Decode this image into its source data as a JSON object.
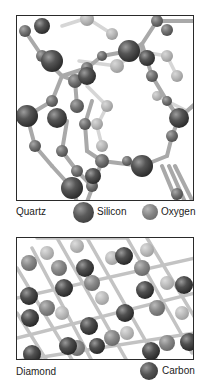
{
  "figure": {
    "panels": [
      {
        "id": "quartz",
        "name": "Quartz",
        "legend": [
          {
            "label": "Silicon",
            "color": "#4a4a4a",
            "size": "large"
          },
          {
            "label": "Oxygen",
            "color": "#808080",
            "size": "small"
          }
        ]
      },
      {
        "id": "diamond",
        "name": "Diamond",
        "legend": [
          {
            "label": "Carbon",
            "color": "#454545",
            "size": "large"
          }
        ]
      }
    ],
    "colors": {
      "bond": "#b5b5b5",
      "bond_dark": "#8f8f8f",
      "atom_dark": "#444444",
      "atom_mid": "#7a7a7a",
      "atom_light": "#b0b0b0",
      "border": "#2a2a2a"
    }
  }
}
